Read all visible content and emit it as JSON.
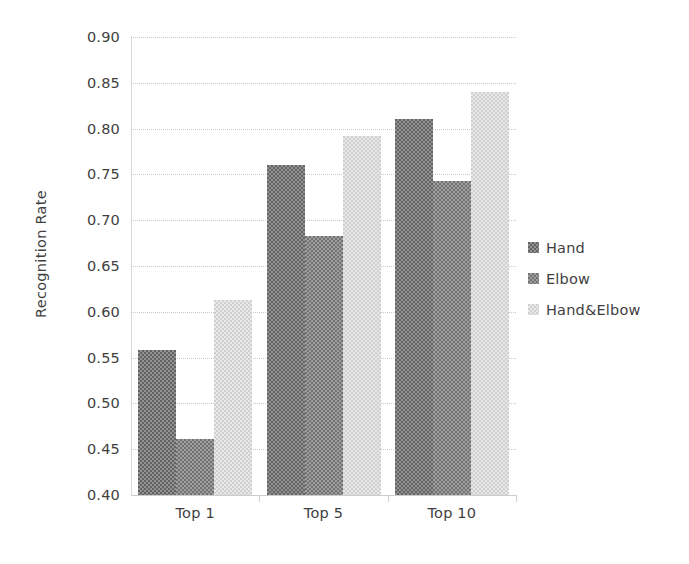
{
  "chart_data": {
    "type": "bar",
    "title": "",
    "subtitle": "",
    "xlabel": "",
    "ylabel": "Recognition Rate",
    "categories": [
      "Top 1",
      "Top 5",
      "Top 10"
    ],
    "series": [
      {
        "name": "Hand",
        "values": [
          0.558,
          0.76,
          0.81
        ],
        "color": "#636363"
      },
      {
        "name": "Elbow",
        "values": [
          0.461,
          0.683,
          0.743
        ],
        "color": "#727272"
      },
      {
        "name": "Hand&Elbow",
        "values": [
          0.613,
          0.792,
          0.84
        ],
        "color": "#cfcfcf"
      }
    ],
    "ylim": [
      0.4,
      0.9
    ],
    "ytick_step": 0.05,
    "ytick_labels": [
      "0.90",
      "0.85",
      "0.80",
      "0.75",
      "0.70",
      "0.65",
      "0.60",
      "0.55",
      "0.50",
      "0.45",
      "0.40"
    ],
    "ytick_values": [
      0.9,
      0.85,
      0.8,
      0.75,
      0.7,
      0.65,
      0.6,
      0.55,
      0.5,
      0.45,
      0.4
    ],
    "grid": true,
    "grid_axis": "y",
    "legend_position": "right",
    "legend_entries": [
      "Hand",
      "Elbow",
      "Hand&Elbow"
    ],
    "background_color": "#ffffff",
    "gridline_color": "#c9c9c9",
    "axis_color": "#d0d0d0",
    "text_color": "#3f3f3f"
  }
}
